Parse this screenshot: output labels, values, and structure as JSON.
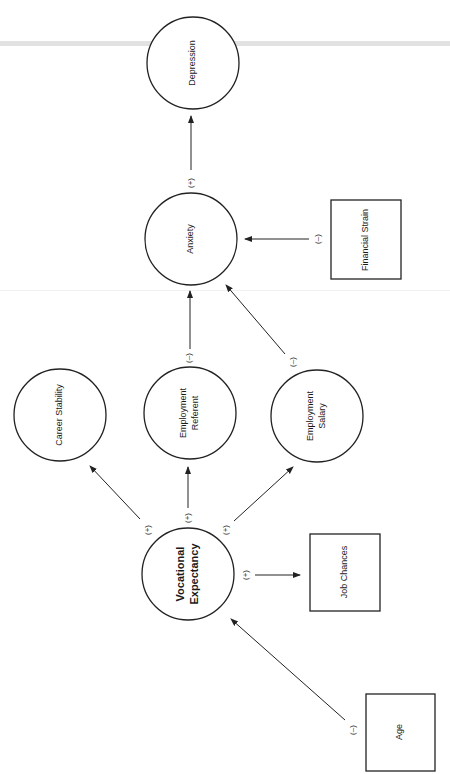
{
  "diagram": {
    "type": "path-diagram",
    "orientation": "rotated -90deg",
    "nodes": [
      {
        "id": "depression",
        "label": "Depression",
        "shape": "circle",
        "cx": 193,
        "cy": 63,
        "r": 46
      },
      {
        "id": "anxiety",
        "label": "Anxiety",
        "shape": "circle",
        "cx": 191,
        "cy": 239,
        "r": 46
      },
      {
        "id": "financial_strain",
        "label": "Financial Strain",
        "shape": "box",
        "x": 331,
        "y": 200,
        "w": 70,
        "h": 79
      },
      {
        "id": "career_stability",
        "label": "Career Stability",
        "shape": "circle",
        "cx": 60,
        "cy": 415,
        "r": 46
      },
      {
        "id": "employment_referent",
        "label_lines": [
          "Employment",
          "Referent"
        ],
        "shape": "circle",
        "cx": 190,
        "cy": 413,
        "r": 46
      },
      {
        "id": "employment_salary",
        "label_lines": [
          "Employment",
          "Salary"
        ],
        "shape": "circle",
        "cx": 317,
        "cy": 416,
        "r": 46
      },
      {
        "id": "vocational_expectancy",
        "label_lines": [
          "Vocational",
          "Expectancy"
        ],
        "shape": "circle",
        "cx": 188,
        "cy": 574,
        "r": 46
      },
      {
        "id": "job_chances",
        "label": "Job Chances",
        "shape": "box",
        "x": 310,
        "y": 534,
        "w": 70,
        "h": 77
      },
      {
        "id": "age",
        "label": "Age",
        "shape": "box",
        "x": 366,
        "y": 694,
        "w": 69,
        "h": 77
      }
    ],
    "edges": [
      {
        "from": "anxiety",
        "to": "depression",
        "sign": "(+)"
      },
      {
        "from": "financial_strain",
        "to": "anxiety",
        "sign": "(–)"
      },
      {
        "from": "employment_referent",
        "to": "anxiety",
        "sign": "(–)"
      },
      {
        "from": "employment_salary",
        "to": "anxiety",
        "sign": "(–)"
      },
      {
        "from": "vocational_expectancy",
        "to": "career_stability",
        "sign": "(+)"
      },
      {
        "from": "vocational_expectancy",
        "to": "employment_referent",
        "sign": "(+)"
      },
      {
        "from": "vocational_expectancy",
        "to": "employment_salary",
        "sign": "(+)"
      },
      {
        "from": "vocational_expectancy",
        "to": "job_chances",
        "sign": "(+)"
      },
      {
        "from": "age",
        "to": "vocational_expectancy",
        "sign": "(–)"
      }
    ]
  },
  "labels": {
    "depression": "Depression",
    "anxiety": "Anxiety",
    "financial_strain": "Financial Strain",
    "career_stability": "Career Stability",
    "employment_referent_1": "Employment",
    "employment_referent_2": "Referent",
    "employment_salary_1": "Employment",
    "employment_salary_2": "Salary",
    "vocational_expectancy_1": "Vocational",
    "vocational_expectancy_2": "Expectancy",
    "job_chances": "Job Chances",
    "age": "Age"
  },
  "signs": {
    "anxiety_depression": "(+)",
    "financial_anxiety": "(–)",
    "referent_anxiety": "(–)",
    "salary_anxiety": "(–)",
    "voc_career": "(+)",
    "voc_referent": "(+)",
    "voc_salary": "(+)",
    "voc_job": "(+)",
    "age_voc": "(–)"
  }
}
